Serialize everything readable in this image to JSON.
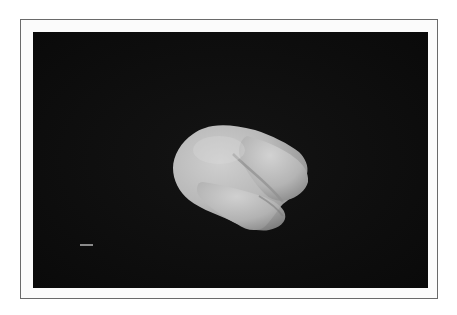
{
  "figure": {
    "frame_color": "#6a6a6a",
    "panel_background": "#0c0c0c",
    "object": {
      "description": "3D rendered smooth bilobed shape",
      "base_color": "#b8b8b8",
      "highlight_color": "#d4d4d4",
      "shadow_color": "#7a7a7a"
    },
    "scale_bar_color": "#8a8a8a"
  }
}
